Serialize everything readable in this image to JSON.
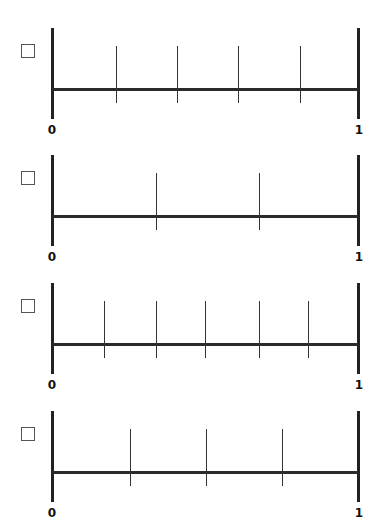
{
  "problems": [
    {
      "id": 1,
      "start_label": "0",
      "end_label": "1",
      "ticks": [
        116,
        177,
        238,
        300
      ],
      "partitions": 5,
      "top": 28,
      "checked": false
    },
    {
      "id": 2,
      "start_label": "0",
      "end_label": "1",
      "ticks": [
        156,
        259
      ],
      "partitions": 3,
      "top": 155,
      "checked": false
    },
    {
      "id": 3,
      "start_label": "0",
      "end_label": "1",
      "ticks": [
        104,
        156,
        205,
        259,
        308
      ],
      "partitions": 6,
      "top": 283,
      "checked": false
    },
    {
      "id": 4,
      "start_label": "0",
      "end_label": "1",
      "ticks": [
        130,
        206,
        282
      ],
      "partitions": 4,
      "top": 411,
      "checked": false
    }
  ],
  "colors": {
    "line": "#222222",
    "background": "#ffffff",
    "checkbox_border": "#555555"
  }
}
